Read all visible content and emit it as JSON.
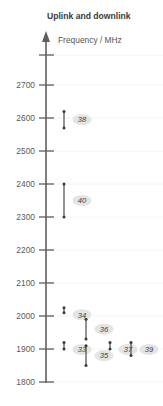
{
  "chart_data": {
    "type": "bar",
    "title": "Uplink and downlink",
    "ylabel": "Frequency / MHz",
    "xlabel": "",
    "ylim": [
      1800,
      2750
    ],
    "grid": true,
    "legend": "none",
    "tick_labels": [
      "2700",
      "2600",
      "2500",
      "2400",
      "2300",
      "2200",
      "2100",
      "2000",
      "1900",
      "1800"
    ],
    "tick_values": [
      2700,
      2600,
      2500,
      2400,
      2300,
      2200,
      2100,
      2000,
      1900,
      1800
    ],
    "categories": [
      "38",
      "40",
      "34",
      "36",
      "33",
      "35",
      "37",
      "39"
    ],
    "series": [
      {
        "name": "Band 38",
        "label": "38",
        "low": 2570,
        "high": 2620,
        "column": 0
      },
      {
        "name": "Band 40",
        "label": "40",
        "low": 2300,
        "high": 2400,
        "column": 0
      },
      {
        "name": "Band 34",
        "label": "34",
        "low": 2010,
        "high": 2025,
        "column": 0
      },
      {
        "name": "Band 36",
        "label": "36",
        "low": 1930,
        "high": 1990,
        "column": 1
      },
      {
        "name": "Band 33",
        "label": "33",
        "low": 1900,
        "high": 1920,
        "column": 0
      },
      {
        "name": "Band 35",
        "label": "35",
        "low": 1850,
        "high": 1910,
        "column": 1
      },
      {
        "name": "Band 37",
        "label": "37",
        "low": 1900,
        "high": 1920,
        "column": 2
      },
      {
        "name": "Band 39",
        "label": "39",
        "low": 1880,
        "high": 1920,
        "column": 3
      }
    ]
  },
  "axis": {
    "arrow_icon": "up-arrow-icon"
  }
}
